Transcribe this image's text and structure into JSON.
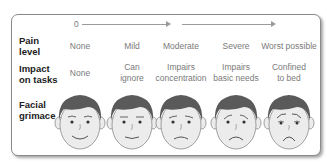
{
  "scale": {
    "ticks": [
      "0",
      "5",
      "10"
    ]
  },
  "rows": {
    "pain_level": {
      "label_line1": "Pain",
      "label_line2": "level",
      "values": [
        "None",
        "Mild",
        "Moderate",
        "Severe",
        "Worst possible"
      ]
    },
    "impact": {
      "label_line1": "Impact",
      "label_line2": "on tasks",
      "values": [
        {
          "l1": "None",
          "l2": ""
        },
        {
          "l1": "Can",
          "l2": "ignore"
        },
        {
          "l1": "Impairs",
          "l2": "concentration"
        },
        {
          "l1": "Impairs",
          "l2": "basic needs"
        },
        {
          "l1": "Confined",
          "l2": "to bed"
        }
      ]
    },
    "grimace": {
      "label_line1": "Facial",
      "label_line2": "grimace",
      "faces": [
        "smiling-face",
        "slight-smile-face",
        "neutral-frown-face",
        "frowning-face",
        "distressed-face"
      ]
    }
  },
  "colors": {
    "hair": "#5a5a5a",
    "skin": "#ececec",
    "outline": "#8a8a8a",
    "text_muted": "#7a7a7a",
    "text_label": "#222222"
  }
}
